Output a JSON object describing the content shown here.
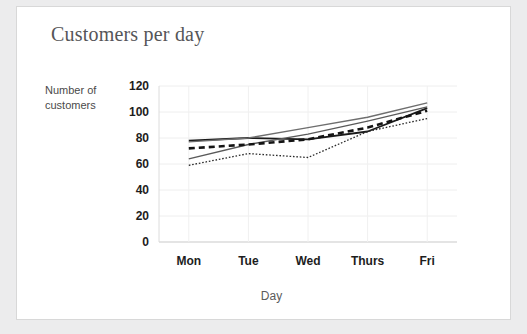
{
  "card": {
    "background": "#ffffff",
    "border_color": "#d8d8d8"
  },
  "page": {
    "background": "#ececed"
  },
  "chart_data": {
    "type": "line",
    "title": "Customers per day",
    "xlabel": "Day",
    "ylabel": "Number of customers",
    "categories": [
      "Mon",
      "Tue",
      "Wed",
      "Thurs",
      "Fri"
    ],
    "x_tick_labels": [
      "Mon",
      "Tue",
      "Wed",
      "Thurs",
      "Fri"
    ],
    "y_tick_labels": [
      "0",
      "20",
      "40",
      "60",
      "80",
      "100",
      "120"
    ],
    "y_ticks": [
      0,
      20,
      40,
      60,
      80,
      100,
      120
    ],
    "ylim": [
      0,
      120
    ],
    "grid": true,
    "legend": false,
    "series": [
      {
        "name": "solid-black-line",
        "style": "solid",
        "color": "#1a1a1a",
        "width": 1.8,
        "values": [
          78,
          80,
          79,
          85,
          103
        ]
      },
      {
        "name": "solid-gray-line",
        "style": "solid",
        "color": "#6e6e6e",
        "width": 1.4,
        "values": [
          77,
          80,
          88,
          96,
          107
        ]
      },
      {
        "name": "rising-gray-line",
        "style": "solid",
        "color": "#5a5a5a",
        "width": 1.3,
        "values": [
          64,
          75,
          83,
          93,
          104
        ]
      },
      {
        "name": "dashed-black-line",
        "style": "dashed",
        "color": "#141414",
        "width": 2.6,
        "values": [
          72,
          75,
          79,
          88,
          101
        ]
      },
      {
        "name": "dotted-line",
        "style": "dotted",
        "color": "#2a2a2a",
        "width": 1.3,
        "values": [
          59,
          68,
          65,
          85,
          95
        ]
      }
    ]
  }
}
